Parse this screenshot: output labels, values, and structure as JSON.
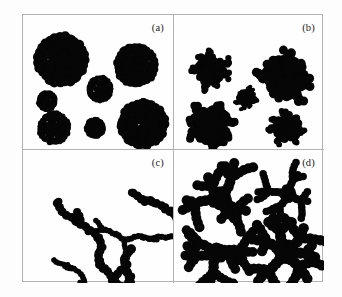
{
  "figure": {
    "background_color": "#fdfdfd",
    "frame_color": "#b3b3b3",
    "cluster_color": "#060606",
    "panel_count": 4,
    "grid": "2x2"
  },
  "panels": [
    {
      "id": "a",
      "label": "(a)",
      "morphology": "compact",
      "cluster_count": 7,
      "description": "dense compact quasi-circular aggregates"
    },
    {
      "id": "b",
      "label": "(b)",
      "morphology": "lobed-compact",
      "cluster_count": 5,
      "description": "compact aggregates with irregular lobed boundaries"
    },
    {
      "id": "c",
      "label": "(c)",
      "morphology": "chain-like",
      "cluster_count": 5,
      "description": "elongated ramified chain-like aggregates"
    },
    {
      "id": "d",
      "label": "(d)",
      "morphology": "dendritic",
      "cluster_count": 4,
      "description": "branched dendritic aggregates with radiating arms"
    }
  ],
  "chart_data": {
    "type": "scatter",
    "title": "",
    "xlabel": "",
    "ylabel": "",
    "grid": false,
    "legend": "none",
    "panels": [
      {
        "label": "(a)",
        "xlim": [
          0,
          150
        ],
        "ylim": [
          0,
          134
        ],
        "clusters": [
          {
            "cx": 38,
            "cy": 45,
            "r": 26,
            "seed": 11,
            "ramification": 0.12,
            "lobes": 9
          },
          {
            "cx": 113,
            "cy": 50,
            "r": 21,
            "seed": 23,
            "ramification": 0.13,
            "lobes": 9
          },
          {
            "cx": 77,
            "cy": 74,
            "r": 13,
            "seed": 31,
            "ramification": 0.12,
            "lobes": 8
          },
          {
            "cx": 24,
            "cy": 86,
            "r": 10,
            "seed": 47,
            "ramification": 0.12,
            "lobes": 8
          },
          {
            "cx": 120,
            "cy": 109,
            "r": 24,
            "seed": 59,
            "ramification": 0.1,
            "lobes": 9
          },
          {
            "cx": 31,
            "cy": 113,
            "r": 16,
            "seed": 71,
            "ramification": 0.12,
            "lobes": 9
          },
          {
            "cx": 72,
            "cy": 113,
            "r": 10,
            "seed": 83,
            "ramification": 0.13,
            "lobes": 8
          }
        ]
      },
      {
        "label": "(b)",
        "xlim": [
          0,
          151
        ],
        "ylim": [
          0,
          134
        ],
        "clusters": [
          {
            "cx": 37,
            "cy": 55,
            "r": 20,
            "seed": 101,
            "ramification": 0.3,
            "lobes": 7
          },
          {
            "cx": 112,
            "cy": 62,
            "r": 29,
            "seed": 113,
            "ramification": 0.32,
            "lobes": 7
          },
          {
            "cx": 73,
            "cy": 83,
            "r": 12,
            "seed": 127,
            "ramification": 0.28,
            "lobes": 7
          },
          {
            "cx": 38,
            "cy": 111,
            "r": 26,
            "seed": 139,
            "ramification": 0.34,
            "lobes": 8
          },
          {
            "cx": 114,
            "cy": 112,
            "r": 19,
            "seed": 151,
            "ramification": 0.3,
            "lobes": 7
          }
        ]
      },
      {
        "label": "(c)",
        "xlim": [
          0,
          150
        ],
        "ylim": [
          0,
          134
        ],
        "clusters": [
          {
            "cx": 30,
            "cy": 50,
            "r": 22,
            "seed": 211,
            "ramification": 0.62,
            "lobes": 6,
            "elongation": 2.3,
            "angle": 78
          },
          {
            "cx": 105,
            "cy": 42,
            "r": 22,
            "seed": 223,
            "ramification": 0.6,
            "lobes": 6,
            "elongation": 1.9,
            "angle": 35
          },
          {
            "cx": 73,
            "cy": 80,
            "r": 15,
            "seed": 233,
            "ramification": 0.58,
            "lobes": 6,
            "elongation": 1.8,
            "angle": 20
          },
          {
            "cx": 110,
            "cy": 95,
            "r": 24,
            "seed": 241,
            "ramification": 0.63,
            "lobes": 6,
            "elongation": 2.0,
            "angle": 110
          },
          {
            "cx": 28,
            "cy": 110,
            "r": 12,
            "seed": 257,
            "ramification": 0.58,
            "lobes": 5,
            "elongation": 1.7,
            "angle": 60
          }
        ]
      },
      {
        "label": "(d)",
        "xlim": [
          0,
          151
        ],
        "ylim": [
          0,
          134
        ],
        "clusters": [
          {
            "cx": 46,
            "cy": 49,
            "r": 28,
            "seed": 311,
            "ramification": 0.8,
            "lobes": 5,
            "arms": 5
          },
          {
            "cx": 114,
            "cy": 44,
            "r": 21,
            "seed": 331,
            "ramification": 0.78,
            "lobes": 4,
            "arms": 4
          },
          {
            "cx": 42,
            "cy": 104,
            "r": 27,
            "seed": 347,
            "ramification": 0.82,
            "lobes": 5,
            "arms": 5
          },
          {
            "cx": 112,
            "cy": 102,
            "r": 29,
            "seed": 359,
            "ramification": 0.8,
            "lobes": 6,
            "arms": 6
          }
        ]
      }
    ]
  }
}
